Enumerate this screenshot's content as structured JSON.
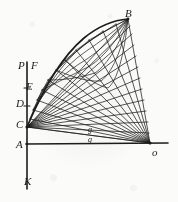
{
  "figure": {
    "background_color": "#fbfbf9",
    "ink_color": "#1c1c1a",
    "width": 178,
    "height": 202,
    "labels": [
      {
        "id": "P",
        "text": "P",
        "x": 18,
        "y": 60,
        "size": "major"
      },
      {
        "id": "F",
        "text": "F",
        "x": 31,
        "y": 60,
        "size": "major"
      },
      {
        "id": "E",
        "text": "E",
        "x": 26,
        "y": 81,
        "size": "major"
      },
      {
        "id": "D",
        "text": "D",
        "x": 16,
        "y": 98,
        "size": "major"
      },
      {
        "id": "C",
        "text": "C",
        "x": 16,
        "y": 119,
        "size": "major"
      },
      {
        "id": "A",
        "text": "A",
        "x": 16,
        "y": 139,
        "size": "major"
      },
      {
        "id": "K",
        "text": "K",
        "x": 24,
        "y": 176,
        "size": "major"
      },
      {
        "id": "B",
        "text": "B",
        "x": 125,
        "y": 8,
        "size": "major"
      },
      {
        "id": "o",
        "text": "o",
        "x": 152,
        "y": 147,
        "size": "major"
      },
      {
        "id": "g-upper",
        "text": "g",
        "x": 88,
        "y": 126,
        "size": "minor"
      },
      {
        "id": "g-lower",
        "text": "g",
        "x": 88,
        "y": 136,
        "size": "minor"
      }
    ],
    "points": {
      "A": {
        "x": 27,
        "y": 144
      },
      "C": {
        "x": 27,
        "y": 127
      },
      "D": {
        "x": 27,
        "y": 106
      },
      "E": {
        "x": 27,
        "y": 88
      },
      "P": {
        "x": 27,
        "y": 64
      },
      "K": {
        "x": 27,
        "y": 188
      },
      "B": {
        "x": 128,
        "y": 19
      },
      "o": {
        "x": 150,
        "y": 143
      }
    },
    "axes": {
      "vertical_label": "P-K axis",
      "horizontal_label": "A-o baseline"
    },
    "rays": {
      "from_C_count": 13,
      "from_o_count": 13
    }
  }
}
